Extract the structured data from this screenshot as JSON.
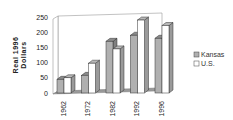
{
  "chart_data": {
    "type": "bar",
    "title": "",
    "xlabel": "",
    "ylabel": "Real 1996 Dollars",
    "ylabel_lines": [
      "Real  1996",
      "Dollars"
    ],
    "ylim": [
      0,
      250
    ],
    "yticks": [
      "0",
      "50",
      "100",
      "150",
      "200",
      "250"
    ],
    "categories": [
      "1962",
      "1972",
      "1982",
      "1992",
      "1996"
    ],
    "series": [
      {
        "name": "Kansas",
        "values": [
          45,
          58,
          170,
          190,
          180
        ],
        "color": "#b0b0b0"
      },
      {
        "name": "U.S.",
        "values": [
          50,
          98,
          145,
          240,
          222
        ],
        "color": "#ffffff"
      }
    ],
    "legend_position": "right",
    "grid": false,
    "style": "3d"
  }
}
